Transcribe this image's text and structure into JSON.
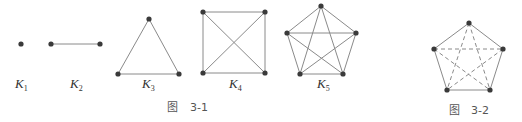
{
  "figure_3_1": {
    "caption_prefix": "图",
    "caption_number": "3-1",
    "graphs": [
      {
        "name": "K",
        "sub": "1",
        "label_x": 21,
        "nodes": [
          [
            21,
            44
          ]
        ],
        "edges": []
      },
      {
        "name": "K",
        "sub": "2",
        "label_x": 76,
        "nodes": [
          [
            51,
            44
          ],
          [
            100,
            44
          ]
        ],
        "edges": [
          [
            0,
            1
          ]
        ]
      },
      {
        "name": "K",
        "sub": "3",
        "label_x": 148,
        "nodes": [
          [
            149,
            19
          ],
          [
            118,
            74
          ],
          [
            179,
            74
          ]
        ],
        "edges": [
          [
            0,
            1
          ],
          [
            0,
            2
          ],
          [
            1,
            2
          ]
        ]
      },
      {
        "name": "K",
        "sub": "4",
        "label_x": 235,
        "nodes": [
          [
            203,
            12
          ],
          [
            265,
            12
          ],
          [
            203,
            73
          ],
          [
            265,
            73
          ]
        ],
        "edges": [
          [
            0,
            1
          ],
          [
            0,
            2
          ],
          [
            0,
            3
          ],
          [
            1,
            2
          ],
          [
            1,
            3
          ],
          [
            2,
            3
          ]
        ]
      },
      {
        "name": "K",
        "sub": "5",
        "label_x": 323,
        "nodes": [
          [
            321,
            6
          ],
          [
            287,
            33
          ],
          [
            356,
            33
          ],
          [
            300,
            74
          ],
          [
            343,
            74
          ]
        ],
        "edges": [
          [
            0,
            1
          ],
          [
            0,
            2
          ],
          [
            0,
            3
          ],
          [
            0,
            4
          ],
          [
            1,
            2
          ],
          [
            1,
            3
          ],
          [
            1,
            4
          ],
          [
            2,
            3
          ],
          [
            2,
            4
          ],
          [
            3,
            4
          ]
        ]
      }
    ]
  },
  "figure_3_2": {
    "caption_prefix": "图",
    "caption_number": "3-2",
    "nodes": [
      [
        469,
        23
      ],
      [
        434,
        49
      ],
      [
        503,
        49
      ],
      [
        447,
        90
      ],
      [
        490,
        90
      ]
    ],
    "solid_edges": [
      [
        0,
        1
      ],
      [
        0,
        2
      ],
      [
        1,
        3
      ],
      [
        2,
        4
      ],
      [
        3,
        4
      ]
    ],
    "dashed_edges": [
      [
        0,
        3
      ],
      [
        0,
        4
      ],
      [
        1,
        2
      ],
      [
        1,
        4
      ],
      [
        2,
        3
      ]
    ]
  }
}
